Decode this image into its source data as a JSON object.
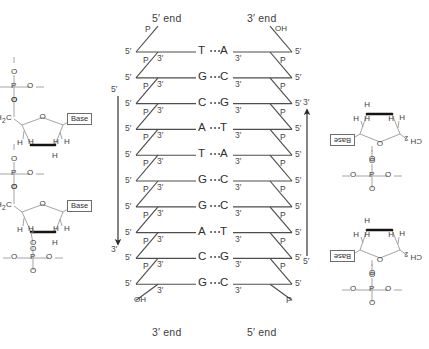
{
  "figure": {
    "ink_color": "#3a3a3a",
    "background": "#ffffff"
  },
  "end_labels": {
    "top_left": "5′ end",
    "top_right": "3′ end",
    "bottom_left": "3′ end",
    "bottom_right": "5′ end"
  },
  "strand_arrows": [
    {
      "name": "left-strand-arrow",
      "start_label": "5′",
      "end_label": "3′",
      "direction": "down"
    },
    {
      "name": "right-strand-arrow",
      "start_label": "5′",
      "end_label": "3′",
      "direction": "up"
    }
  ],
  "ladder": {
    "hbond_symbol": "⋯",
    "left_prime_label": "5′",
    "right_inner_prime_label": "3′",
    "right_prime_label": "5′",
    "left_inner_prime_label": "3′",
    "phosphate_label": "P",
    "hydroxyl_label": "OH",
    "left_terminus_top": "P",
    "left_terminus_bottom": "OH",
    "right_terminus_top": "OH",
    "right_terminus_bottom": "P",
    "base_pairs": [
      {
        "left": "T",
        "right": "A"
      },
      {
        "left": "G",
        "right": "C"
      },
      {
        "left": "C",
        "right": "G"
      },
      {
        "left": "A",
        "right": "T"
      },
      {
        "left": "T",
        "right": "A"
      },
      {
        "left": "G",
        "right": "C"
      },
      {
        "left": "G",
        "right": "C"
      },
      {
        "left": "A",
        "right": "T"
      },
      {
        "left": "C",
        "right": "G"
      },
      {
        "left": "G",
        "right": "C"
      }
    ]
  },
  "sugars": {
    "base_label": "Base",
    "upright": {
      "ch2_label": "H",
      "ch2_sub": "2",
      "ch2_c": "C",
      "ring_oxygen": "O",
      "h_labels": [
        "H",
        "H",
        "H",
        "H",
        "H"
      ],
      "ester_oxygen": "O"
    },
    "inverted": {
      "ch2_label": "CH",
      "ch2_sub": "2",
      "ring_oxygen": "O",
      "h_labels": [
        "H",
        "H",
        "H",
        "H",
        "H"
      ],
      "ester_oxygen": "O"
    },
    "phosphate": {
      "p_label": "P",
      "oxygens": [
        "O",
        "O",
        "O",
        "O"
      ]
    }
  },
  "panels": [
    {
      "name": "left-upper-nucleotide",
      "orientation": "upright"
    },
    {
      "name": "left-lower-nucleotide",
      "orientation": "upright"
    },
    {
      "name": "right-upper-nucleotide",
      "orientation": "inverted"
    },
    {
      "name": "right-lower-nucleotide",
      "orientation": "inverted"
    }
  ]
}
